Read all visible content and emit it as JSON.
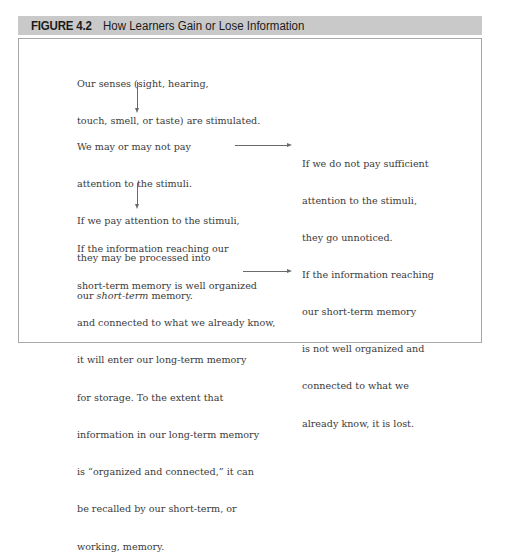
{
  "figure": {
    "number": "FIGURE 4.2",
    "title": "How Learners Gain or Lose Information"
  },
  "colors": {
    "header_bg": "#c9c9c9",
    "border": "#a8a8a8",
    "arrow": "#6a6a6a",
    "text": "#3a3a3a"
  },
  "nodes": {
    "senses": {
      "lines": [
        "Our senses (sight, hearing,",
        "touch, smell, or taste) are stimulated."
      ]
    },
    "attention": {
      "lines": [
        "We may or may not pay",
        "attention to the stimuli.",
        "If we pay attention to the stimuli,",
        "they may be processed into"
      ],
      "last_prefix": "our ",
      "last_italic": "short-term",
      "last_suffix": " memory."
    },
    "unnoticed": {
      "lines": [
        "If we do not pay sufficient",
        "attention to the stimuli,",
        "they go unnoticed."
      ]
    },
    "long_term": {
      "lines": [
        "If the information reaching our",
        "short-term memory is well organized",
        "and connected to what we already know,",
        "it will enter our long-term memory",
        "for storage. To the extent that",
        "information in our long-term memory",
        "is “organized and connected,” it can",
        "be recalled by our short-term, or",
        "working, memory."
      ]
    },
    "lost": {
      "lines": [
        "If the information reaching",
        "our short-term memory",
        "is not well organized and",
        "connected to what we",
        "already know, it is lost."
      ]
    }
  },
  "edges": [
    {
      "from": "senses",
      "to": "attention",
      "direction": "down"
    },
    {
      "from": "attention",
      "to": "unnoticed",
      "direction": "right"
    },
    {
      "from": "attention",
      "to": "long_term",
      "direction": "down"
    },
    {
      "from": "long_term",
      "to": "lost",
      "direction": "right"
    }
  ]
}
